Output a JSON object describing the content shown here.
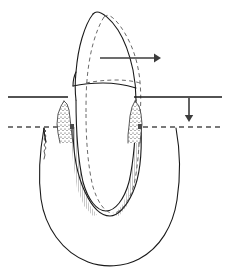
{
  "figure": {
    "title": "Tooth displacement in alveolar socket diagram",
    "caption": "",
    "width": 228,
    "height": 273,
    "background_color": "#ffffff",
    "line_color": "#1a1a1a",
    "dashed_color": "#6b6b6b",
    "arrow_color": "#3c3c3c"
  },
  "labels": {
    "crown": "tooth-crown",
    "root": "tooth-root",
    "bone": "alveolar-bone",
    "gingiva_left": "left-gingival-papilla",
    "gingiva_right": "right-gingival-papilla",
    "displaced_outline": "displaced-tooth-outline",
    "gingival_reference_line": "gingival-margin-reference-line",
    "bone_reference_line": "bone-level-reference-line",
    "horizontal_arrow": "horizontal-displacement-arrow",
    "vertical_arrow": "vertical-displacement-arrow"
  },
  "annotations": {
    "horizontal_arrow_direction": "right",
    "vertical_arrow_direction": "down",
    "horizontal_arrow_label": "",
    "vertical_arrow_label": ""
  },
  "reference_lines": {
    "gingival": {
      "y": 97,
      "style": "solid",
      "left_x": 8,
      "right_x": 222
    },
    "bone": {
      "y": 127,
      "style": "dashed",
      "left_x": 8,
      "right_x": 222
    }
  },
  "arrows": {
    "horizontal": {
      "x1": 100,
      "y1": 58,
      "x2": 161,
      "y2": 58
    },
    "vertical": {
      "x1": 189,
      "y1": 98,
      "x2": 189,
      "y2": 122
    }
  }
}
